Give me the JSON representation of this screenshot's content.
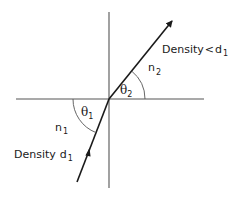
{
  "diagram": {
    "type": "refraction",
    "colors": {
      "ink": "#1a1a1a",
      "background": "#ffffff"
    },
    "geometry": {
      "origin": [
        109,
        99
      ],
      "horizontal_axis": {
        "x1": 16,
        "x2": 204,
        "y": 99
      },
      "vertical_axis": {
        "x": 109,
        "y1": 12,
        "y2": 188
      },
      "refracted_ray": {
        "from": [
          109,
          99
        ],
        "to": [
          174,
          19
        ],
        "arrowhead": "end"
      },
      "incident_ray": {
        "from": [
          77,
          182
        ],
        "to": [
          109,
          99
        ],
        "midpoint_arrow": [
          88,
          152
        ]
      },
      "angle_arcs": {
        "theta1_radius": 36,
        "theta2_radius": 36
      }
    },
    "labels": {
      "upper_density": {
        "text": "Density",
        "relation": "<",
        "var": "d",
        "sub": "1"
      },
      "upper_index": {
        "var": "n",
        "sub": "2"
      },
      "angle_upper": {
        "var": "θ",
        "sub": "2"
      },
      "angle_lower": {
        "var": "θ",
        "sub": "1"
      },
      "lower_index": {
        "var": "n",
        "sub": "1"
      },
      "lower_density": {
        "text": "Density",
        "var": "d",
        "sub": "1"
      }
    }
  }
}
